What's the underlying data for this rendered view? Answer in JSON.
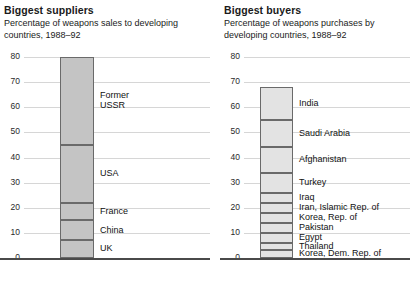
{
  "panels": [
    {
      "id": "suppliers",
      "title": "Biggest suppliers",
      "subtitle": "Percentage of weapons sales to developing countries, 1988–92"
    },
    {
      "id": "buyers",
      "title": "Biggest buyers",
      "subtitle": "Percentage of weapons purchases by developing countries, 1988–92"
    }
  ],
  "axis": {
    "ticks": [
      "80",
      "70",
      "60",
      "50",
      "40",
      "30",
      "20",
      "10",
      "0"
    ]
  },
  "chart_data": [
    {
      "type": "bar",
      "title": "Biggest suppliers",
      "subtitle": "Percentage of weapons sales to developing countries, 1988–92",
      "xlabel": "",
      "ylabel": "",
      "ylim": [
        0,
        80
      ],
      "yticks": [
        0,
        10,
        20,
        30,
        40,
        50,
        60,
        70,
        80
      ],
      "grid": true,
      "legend": "none",
      "stacked": true,
      "categories": [
        "Former USSR",
        "USA",
        "France",
        "China",
        "UK"
      ],
      "values": [
        35,
        23,
        7,
        8,
        7
      ],
      "segments": [
        {
          "label": "Former USSR",
          "label_lines": [
            "Former",
            "USSR"
          ],
          "start": 45,
          "end": 80,
          "value": 35
        },
        {
          "label": "USA",
          "label_lines": [
            "USA"
          ],
          "start": 22,
          "end": 45,
          "value": 23
        },
        {
          "label": "France",
          "label_lines": [
            "France"
          ],
          "start": 15,
          "end": 22,
          "value": 7
        },
        {
          "label": "China",
          "label_lines": [
            "China"
          ],
          "start": 7,
          "end": 15,
          "value": 8
        },
        {
          "label": "UK",
          "label_lines": [
            "UK"
          ],
          "start": 0,
          "end": 7,
          "value": 7
        }
      ]
    },
    {
      "type": "bar",
      "title": "Biggest buyers",
      "subtitle": "Percentage of weapons purchases by developing countries, 1988–92",
      "xlabel": "",
      "ylabel": "",
      "ylim": [
        0,
        80
      ],
      "yticks": [
        0,
        10,
        20,
        30,
        40,
        50,
        60,
        70,
        80
      ],
      "grid": true,
      "legend": "none",
      "stacked": true,
      "categories": [
        "India",
        "Saudi Arabia",
        "Afghanistan",
        "Turkey",
        "Iraq",
        "Iran, Islamic Rep. of",
        "Korea, Rep. of",
        "Pakistan",
        "Egypt",
        "Thailand",
        "Korea, Dem. Rep. of"
      ],
      "values": [
        13,
        11,
        10,
        8,
        4,
        4,
        4,
        4,
        4,
        3,
        3
      ],
      "segments": [
        {
          "label": "India",
          "start": 55,
          "end": 68,
          "value": 13
        },
        {
          "label": "Saudi Arabia",
          "start": 44,
          "end": 55,
          "value": 11
        },
        {
          "label": "Afghanistan",
          "start": 34,
          "end": 44,
          "value": 10
        },
        {
          "label": "Turkey",
          "start": 26,
          "end": 34,
          "value": 8
        },
        {
          "label": "Iraq",
          "start": 22,
          "end": 26,
          "value": 4
        },
        {
          "label": "Iran, Islamic Rep. of",
          "start": 18,
          "end": 22,
          "value": 4
        },
        {
          "label": "Korea, Rep. of",
          "start": 14,
          "end": 18,
          "value": 4
        },
        {
          "label": "Pakistan",
          "start": 10,
          "end": 14,
          "value": 4
        },
        {
          "label": "Egypt",
          "start": 6,
          "end": 10,
          "value": 4
        },
        {
          "label": "Thailand",
          "start": 3,
          "end": 6,
          "value": 3
        },
        {
          "label": "Korea, Dem. Rep. of",
          "start": 0,
          "end": 3,
          "value": 3
        }
      ]
    }
  ],
  "colors": {
    "suppliers_fill": "#c4c4c4",
    "buyers_fill": "#e3e3e3",
    "bar_border": "#6a6a6a",
    "gridline": "#d6d6d6",
    "axis": "#4a4a4a",
    "text": "#1a1a1a"
  }
}
